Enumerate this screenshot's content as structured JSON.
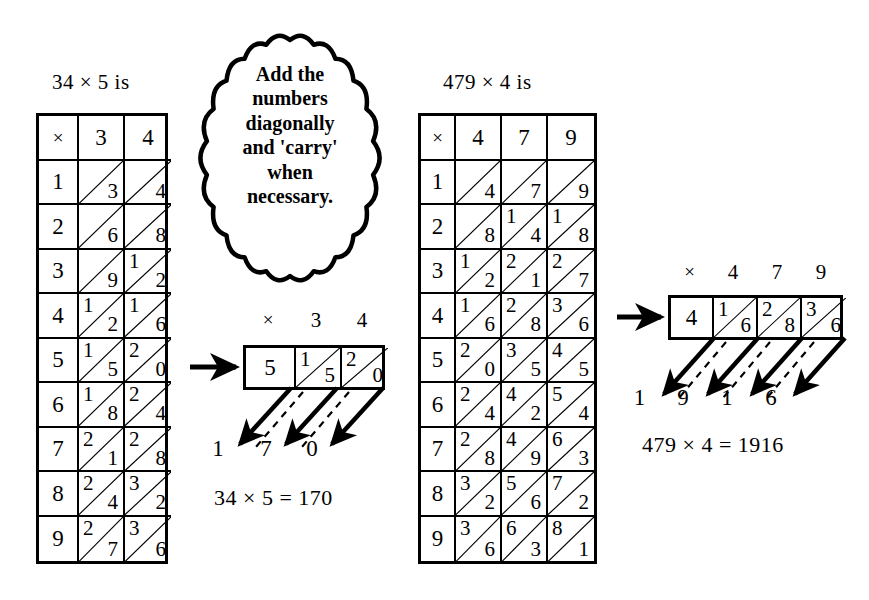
{
  "page": {
    "background": "#ffffff",
    "ink": "#000000"
  },
  "speech_bubble": {
    "name": "instruction-bubble",
    "lines": [
      "Add the",
      "numbers",
      "diagonally",
      "and 'carry'",
      "when",
      "necessary."
    ],
    "text": "Add the numbers diagonally and 'carry' when necessary."
  },
  "left_example": {
    "caption": "34 × 5 is",
    "multiplicand": "34",
    "multiplier": "5",
    "table": {
      "corner_symbol": "×",
      "column_headers": [
        "3",
        "4"
      ],
      "row_headers": [
        "1",
        "2",
        "3",
        "4",
        "5",
        "6",
        "7",
        "8",
        "9"
      ],
      "products": [
        [
          {
            "tens": "",
            "units": "3"
          },
          {
            "tens": "",
            "units": "4"
          }
        ],
        [
          {
            "tens": "",
            "units": "6"
          },
          {
            "tens": "",
            "units": "8"
          }
        ],
        [
          {
            "tens": "",
            "units": "9"
          },
          {
            "tens": "1",
            "units": "2"
          }
        ],
        [
          {
            "tens": "1",
            "units": "2"
          },
          {
            "tens": "1",
            "units": "6"
          }
        ],
        [
          {
            "tens": "1",
            "units": "5"
          },
          {
            "tens": "2",
            "units": "0"
          }
        ],
        [
          {
            "tens": "1",
            "units": "8"
          },
          {
            "tens": "2",
            "units": "4"
          }
        ],
        [
          {
            "tens": "2",
            "units": "1"
          },
          {
            "tens": "2",
            "units": "8"
          }
        ],
        [
          {
            "tens": "2",
            "units": "4"
          },
          {
            "tens": "3",
            "units": "2"
          }
        ],
        [
          {
            "tens": "2",
            "units": "7"
          },
          {
            "tens": "3",
            "units": "6"
          }
        ]
      ]
    },
    "result_strip": {
      "headers": [
        "×",
        "3",
        "4"
      ],
      "cells": [
        {
          "type": "plain",
          "value": "5"
        },
        {
          "type": "split",
          "tens": "1",
          "units": "5"
        },
        {
          "type": "split",
          "tens": "2",
          "units": "0"
        }
      ]
    },
    "answer_digits": [
      "1",
      "7",
      "0"
    ],
    "equation": "34 × 5 = 170"
  },
  "right_example": {
    "caption": "479 × 4 is",
    "multiplicand": "479",
    "multiplier": "4",
    "table": {
      "corner_symbol": "×",
      "column_headers": [
        "4",
        "7",
        "9"
      ],
      "row_headers": [
        "1",
        "2",
        "3",
        "4",
        "5",
        "6",
        "7",
        "8",
        "9"
      ],
      "products": [
        [
          {
            "tens": "",
            "units": "4"
          },
          {
            "tens": "",
            "units": "7"
          },
          {
            "tens": "",
            "units": "9"
          }
        ],
        [
          {
            "tens": "",
            "units": "8"
          },
          {
            "tens": "1",
            "units": "4"
          },
          {
            "tens": "1",
            "units": "8"
          }
        ],
        [
          {
            "tens": "1",
            "units": "2"
          },
          {
            "tens": "2",
            "units": "1"
          },
          {
            "tens": "2",
            "units": "7"
          }
        ],
        [
          {
            "tens": "1",
            "units": "6"
          },
          {
            "tens": "2",
            "units": "8"
          },
          {
            "tens": "3",
            "units": "6"
          }
        ],
        [
          {
            "tens": "2",
            "units": "0"
          },
          {
            "tens": "3",
            "units": "5"
          },
          {
            "tens": "4",
            "units": "5"
          }
        ],
        [
          {
            "tens": "2",
            "units": "4"
          },
          {
            "tens": "4",
            "units": "2"
          },
          {
            "tens": "5",
            "units": "4"
          }
        ],
        [
          {
            "tens": "2",
            "units": "8"
          },
          {
            "tens": "4",
            "units": "9"
          },
          {
            "tens": "6",
            "units": "3"
          }
        ],
        [
          {
            "tens": "3",
            "units": "2"
          },
          {
            "tens": "5",
            "units": "6"
          },
          {
            "tens": "7",
            "units": "2"
          }
        ],
        [
          {
            "tens": "3",
            "units": "6"
          },
          {
            "tens": "6",
            "units": "3"
          },
          {
            "tens": "8",
            "units": "1"
          }
        ]
      ]
    },
    "result_strip": {
      "headers": [
        "×",
        "4",
        "7",
        "9"
      ],
      "cells": [
        {
          "type": "plain",
          "value": "4"
        },
        {
          "type": "split",
          "tens": "1",
          "units": "6"
        },
        {
          "type": "split",
          "tens": "2",
          "units": "8"
        },
        {
          "type": "split",
          "tens": "3",
          "units": "6"
        }
      ]
    },
    "answer_digits": [
      "1",
      "9",
      "1",
      "6"
    ],
    "equation": "479 × 4 = 1916"
  }
}
